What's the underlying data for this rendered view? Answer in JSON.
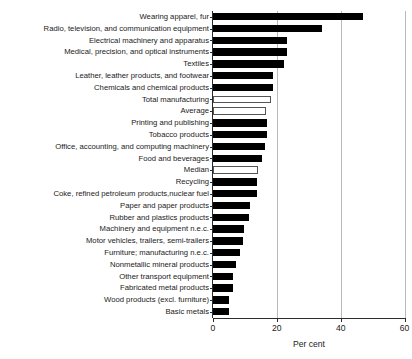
{
  "chart_data": {
    "type": "bar",
    "orientation": "horizontal",
    "title": "",
    "xlabel": "Per cent",
    "ylabel": "",
    "xlim": [
      0,
      60
    ],
    "xticks": [
      0,
      20,
      40,
      60
    ],
    "grid": true,
    "legend": null,
    "categories": [
      "Wearing apparel, fur",
      "Radio, television, and communication equipment",
      "Electrical machinery and apparatus",
      "Medical, precision, and optical instruments",
      "Textiles",
      "Leather, leather products, and footwear",
      "Chemicals and chemical products",
      "Total manufacturing",
      "Average",
      "Printing and publishing",
      "Tobacco products",
      "Office, accounting, and computing machinery",
      "Food and beverages",
      "Median",
      "Recycling",
      "Coke, refined petroleum products,nuclear fuel",
      "Paper and paper products",
      "Rubber and plastics products",
      "Machinery and equipment n.e.c.",
      "Motor vehicles, trailers, semi-trailers",
      "Furniture; manufacturing n.e.c.",
      "Nonmetallic mineral products",
      "Other transport equipment",
      "Fabricated metal products",
      "Wood products (excl. furniture)",
      "Basic metals"
    ],
    "values": [
      47.0,
      34.0,
      23.2,
      23.2,
      22.3,
      18.8,
      18.7,
      18.3,
      16.5,
      17.0,
      16.8,
      16.2,
      15.2,
      14.0,
      13.8,
      13.7,
      11.6,
      11.2,
      9.7,
      9.4,
      8.5,
      7.2,
      6.3,
      6.3,
      5.1,
      5.0
    ],
    "styles": [
      "filled",
      "filled",
      "filled",
      "filled",
      "filled",
      "filled",
      "filled",
      "open",
      "open",
      "filled",
      "filled",
      "filled",
      "filled",
      "open",
      "filled",
      "filled",
      "filled",
      "filled",
      "filled",
      "filled",
      "filled",
      "filled",
      "filled",
      "filled",
      "filled",
      "filled"
    ],
    "colors": {
      "bar_filled": "#000000",
      "bar_open_fill": "#ffffff",
      "bar_open_edge": "#555555",
      "gridline": "#b9b9b9",
      "axis": "#2b2b2b",
      "text": "#1a1a1a",
      "background": "#ffffff"
    }
  }
}
